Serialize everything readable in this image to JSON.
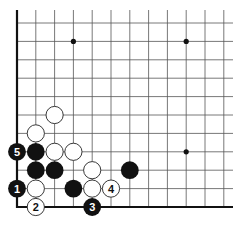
{
  "diagram": {
    "type": "go-board-corner",
    "corner": "bottom-left",
    "grid": {
      "origin_x": 17,
      "origin_y": 207,
      "col_spacing": 18.8,
      "row_spacing": 18.4,
      "cols": 12,
      "rows": 11,
      "line_extend_right": 233,
      "line_extend_top": 10,
      "line_color": "#555555",
      "edge_color": "#111111"
    },
    "star_points": [
      {
        "col": 3,
        "row": 9
      },
      {
        "col": 9,
        "row": 9
      },
      {
        "col": 9,
        "row": 3
      },
      {
        "col": 3,
        "row": 3
      }
    ],
    "stones": [
      {
        "color": "black",
        "col": 0,
        "row": 1,
        "label": "1"
      },
      {
        "color": "white",
        "col": 1,
        "row": 0,
        "label": "2"
      },
      {
        "color": "black",
        "col": 4,
        "row": 0,
        "label": "3"
      },
      {
        "color": "white",
        "col": 5,
        "row": 1,
        "label": "4"
      },
      {
        "color": "black",
        "col": 0,
        "row": 3,
        "label": "5"
      },
      {
        "color": "white",
        "col": 1,
        "row": 1,
        "label": ""
      },
      {
        "color": "black",
        "col": 3,
        "row": 1,
        "label": ""
      },
      {
        "color": "white",
        "col": 4,
        "row": 1,
        "label": ""
      },
      {
        "color": "black",
        "col": 1,
        "row": 2,
        "label": ""
      },
      {
        "color": "black",
        "col": 2,
        "row": 2,
        "label": ""
      },
      {
        "color": "white",
        "col": 4,
        "row": 2,
        "label": ""
      },
      {
        "color": "black",
        "col": 6,
        "row": 2,
        "label": ""
      },
      {
        "color": "black",
        "col": 1,
        "row": 3,
        "label": ""
      },
      {
        "color": "white",
        "col": 2,
        "row": 3,
        "label": ""
      },
      {
        "color": "white",
        "col": 3,
        "row": 3,
        "label": ""
      },
      {
        "color": "white",
        "col": 1,
        "row": 4,
        "label": ""
      },
      {
        "color": "white",
        "col": 2,
        "row": 5,
        "label": ""
      }
    ]
  }
}
